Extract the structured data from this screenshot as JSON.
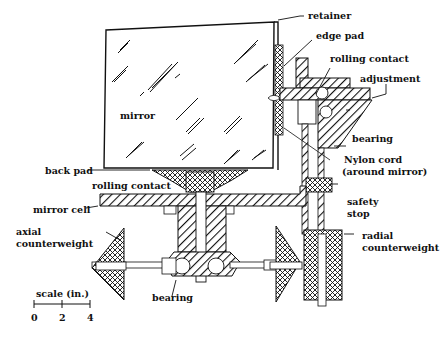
{
  "diagram": {
    "labels": {
      "retainer": "retainer",
      "edge_pad": "edge pad",
      "rolling_contact_top": "rolling contact",
      "adjustment": "adjustment",
      "bearing_right": "bearing",
      "nylon_cord_1": "Nylon cord",
      "nylon_cord_2": "(around mirror)",
      "mirror": "mirror",
      "back_pad": "back pad",
      "rolling_contact_bottom": "rolling contact",
      "mirror_cell": "mirror cell",
      "safety_stop_1": "safety",
      "safety_stop_2": "stop",
      "axial_counterweight_1": "axial",
      "axial_counterweight_2": "counterweight",
      "radial_counterweight_1": "radial",
      "radial_counterweight_2": "counterweight",
      "bearing_bottom": "bearing"
    },
    "scale": {
      "title": "scale (in.)",
      "ticks": [
        "0",
        "2",
        "4"
      ]
    },
    "colors": {
      "ink": "#111111",
      "background": "#ffffff"
    }
  }
}
